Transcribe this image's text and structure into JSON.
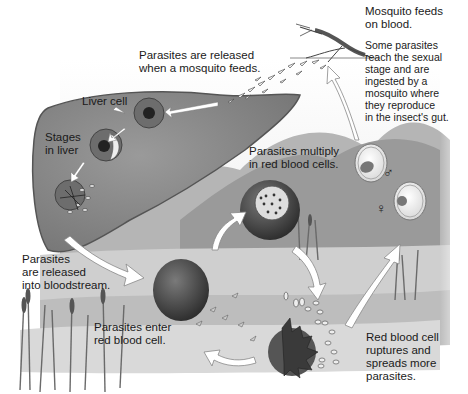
{
  "diagram": {
    "colorscheme": "grayscale",
    "colors": {
      "background": "#ffffff",
      "liver": "#8a8a8a",
      "liver_outline": "#555555",
      "red_blood_cell": "#4a4a4a",
      "water": "#c8c8c8",
      "hills": "#9a9a9a",
      "arrow": "#ffffff",
      "text": "#1a1a1a"
    },
    "labels": {
      "mosquito_feeds": [
        "Mosquito feeds",
        "on blood."
      ],
      "sexual_stage": [
        "Some parasites",
        "reach the sexual",
        "stage and are",
        "ingested by a",
        "mosquito where",
        "they reproduce",
        "in the insect's gut."
      ],
      "released_mosquito": [
        "Parasites are released",
        "when a mosquito feeds."
      ],
      "liver_cell": [
        "Liver cell"
      ],
      "stages_in_liver": [
        "Stages",
        "in liver"
      ],
      "multiply": [
        "Parasites multiply",
        "in red blood cells."
      ],
      "released_bloodstream": [
        "Parasites",
        "are released",
        "into bloodstream."
      ],
      "enter_rbc": [
        "Parasites enter",
        "red blood cell."
      ],
      "rupture": [
        "Red blood cell",
        "ruptures and",
        "spreads more",
        "parasites."
      ]
    },
    "symbols": {
      "male": "♂",
      "female": "♀"
    },
    "stages": [
      {
        "id": "mosquito",
        "description": "Mosquito feeds on blood"
      },
      {
        "id": "sporozoites",
        "description": "Parasites released when mosquito feeds"
      },
      {
        "id": "liver",
        "description": "Liver cell infection and stages in liver"
      },
      {
        "id": "bloodstream",
        "description": "Parasites released into bloodstream"
      },
      {
        "id": "rbc_entry",
        "description": "Parasites enter red blood cell"
      },
      {
        "id": "multiply",
        "description": "Parasites multiply in red blood cells"
      },
      {
        "id": "rupture",
        "description": "Red blood cell ruptures and spreads more parasites"
      },
      {
        "id": "gametocytes",
        "description": "Male and female sexual stages ingested by mosquito"
      }
    ]
  }
}
